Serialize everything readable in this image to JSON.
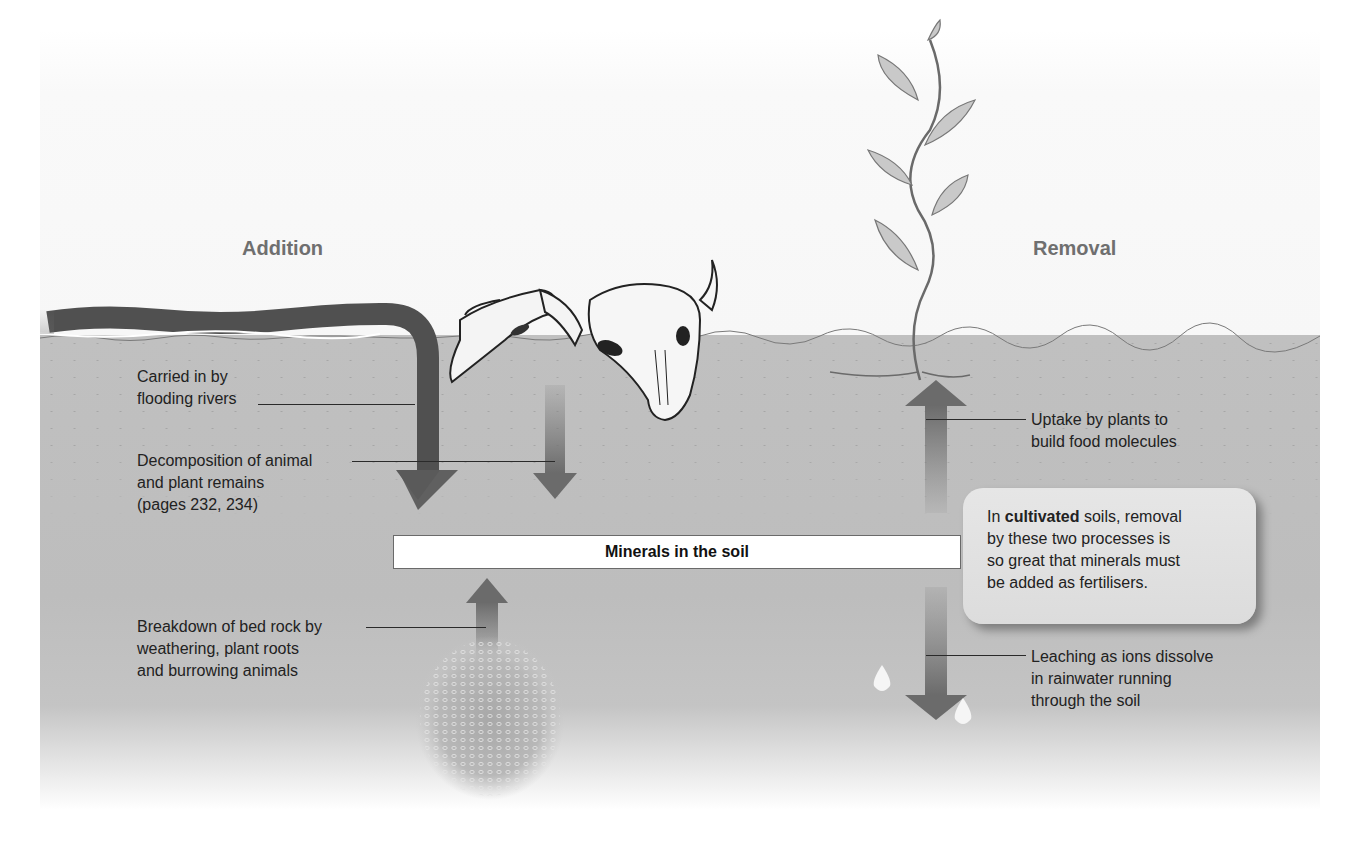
{
  "headings": {
    "addition": "Addition",
    "removal": "Removal"
  },
  "center_box": {
    "label": "Minerals in the soil"
  },
  "addition_processes": [
    {
      "lines": [
        "Carried in by",
        "flooding rivers"
      ],
      "icon": "river-arrow"
    },
    {
      "lines": [
        "Decomposition of animal",
        "and plant remains",
        "(pages 232, 234)"
      ],
      "icon": "animal-skull-arrow"
    },
    {
      "lines": [
        "Breakdown of bed rock by",
        "weathering, plant roots",
        "and burrowing animals"
      ],
      "icon": "bedrock-arrow"
    }
  ],
  "removal_processes": [
    {
      "lines": [
        "Uptake by plants to",
        "build food molecules"
      ],
      "icon": "plant-uptake-arrow"
    },
    {
      "lines": [
        "Leaching as ions dissolve",
        "in rainwater running",
        "through the soil"
      ],
      "icon": "raindrop-leaching-arrow"
    }
  ],
  "note": {
    "prefix": "In ",
    "bold": "cultivated",
    "line1_rest": " soils, removal",
    "line2": "by these two processes is",
    "line3": "so great that minerals must",
    "line4": "be added as fertilisers."
  },
  "colors": {
    "soil": "#bfbfbf",
    "arrow": "#6b6b6b",
    "river": "#555555",
    "heading_text": "#6f6f6f",
    "note_bg": "#e2e2e2"
  }
}
